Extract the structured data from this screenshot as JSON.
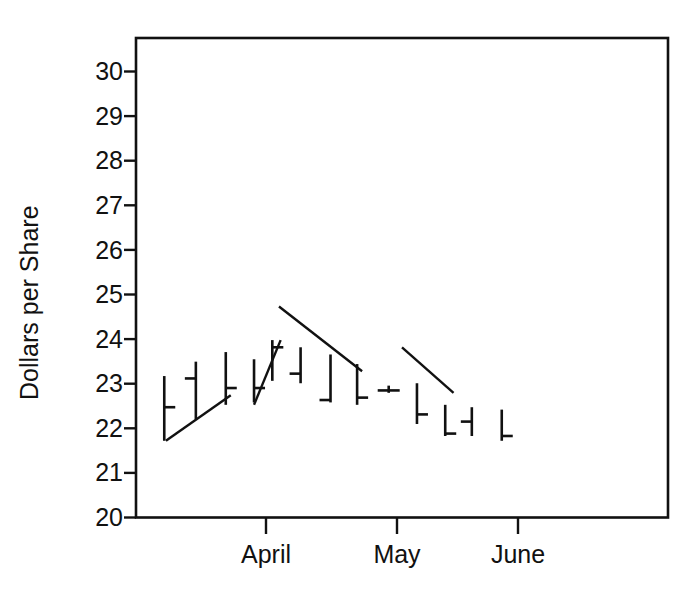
{
  "chart_data": {
    "type": "bar",
    "subtype": "hlc-bar-chart",
    "title": "",
    "subtitle": "",
    "xlabel": "",
    "ylabel": "Dollars per Share",
    "ylim": [
      20,
      30
    ],
    "yticks": [
      20,
      21,
      22,
      23,
      24,
      25,
      26,
      27,
      28,
      29,
      30
    ],
    "ytick_labels": [
      "20",
      "21",
      "22",
      "23",
      "24",
      "25",
      "26",
      "27",
      "28",
      "29",
      "30"
    ],
    "xlim": [
      0,
      16
    ],
    "xtick_positions": [
      3.9,
      7.8,
      11.5
    ],
    "xtick_labels": [
      "April",
      "May",
      "June"
    ],
    "grid": false,
    "legend": null,
    "frame": true,
    "bars": [
      {
        "index": 1,
        "x": 0.85,
        "high": 22.95,
        "low": 21.6,
        "close": 22.3,
        "close_side": "right"
      },
      {
        "index": 2,
        "x": 1.8,
        "high": 23.25,
        "low": 22.05,
        "close": 22.9,
        "close_side": "left"
      },
      {
        "index": 3,
        "x": 2.7,
        "high": 23.45,
        "low": 22.35,
        "close": 22.7,
        "close_side": "right"
      },
      {
        "index": 4,
        "x": 3.55,
        "high": 23.3,
        "low": 22.4,
        "close": 22.7,
        "close_side": "right"
      },
      {
        "index": 5,
        "x": 4.1,
        "high": 23.7,
        "low": 22.85,
        "close": 23.55,
        "close_side": "right"
      },
      {
        "index": 6,
        "x": 4.95,
        "high": 23.55,
        "low": 22.8,
        "close": 23.0,
        "close_side": "left"
      },
      {
        "index": 7,
        "x": 5.85,
        "high": 23.4,
        "low": 22.4,
        "close": 22.45,
        "close_side": "left"
      },
      {
        "index": 8,
        "x": 6.65,
        "high": 23.2,
        "low": 22.35,
        "close": 22.5,
        "close_side": "right"
      },
      {
        "index": 9,
        "x": 7.6,
        "high": 22.75,
        "low": 22.6,
        "close": 22.65,
        "close_side": "both"
      },
      {
        "index": 10,
        "x": 8.45,
        "high": 22.8,
        "low": 21.95,
        "close": 22.15,
        "close_side": "right"
      },
      {
        "index": 11,
        "x": 9.3,
        "high": 22.35,
        "low": 21.7,
        "close": 21.75,
        "close_side": "right"
      },
      {
        "index": 12,
        "x": 10.1,
        "high": 22.3,
        "low": 21.7,
        "close": 22.0,
        "close_side": "left"
      },
      {
        "index": 13,
        "x": 11.0,
        "high": 22.25,
        "low": 21.6,
        "close": 21.7,
        "close_side": "right"
      }
    ],
    "trendlines": [
      {
        "name": "uptrend-1",
        "x1": 0.9,
        "y1": 21.6,
        "x2": 2.85,
        "y2": 22.55
      },
      {
        "name": "uptrend-2",
        "x1": 3.55,
        "y1": 22.35,
        "x2": 4.35,
        "y2": 23.7
      },
      {
        "name": "downtrend-1",
        "x1": 4.3,
        "y1": 24.4,
        "x2": 6.8,
        "y2": 23.05
      },
      {
        "name": "downtrend-2",
        "x1": 8.0,
        "y1": 23.55,
        "x2": 9.55,
        "y2": 22.6
      }
    ]
  }
}
